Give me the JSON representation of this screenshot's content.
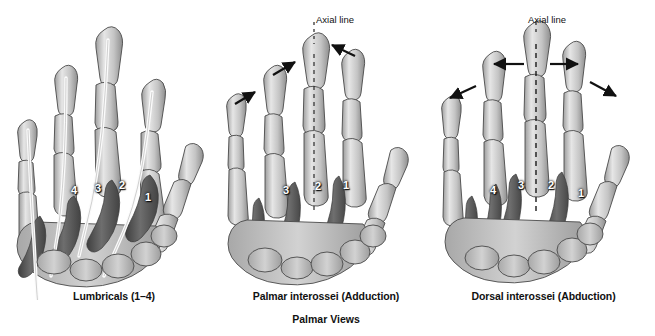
{
  "figure": {
    "title": "Palmar Views",
    "background": "#ffffff",
    "ink": "#111111"
  },
  "panels": [
    {
      "id": "lumbricals",
      "caption": "Lumbricals (1–4)",
      "axial_line_label": "",
      "has_axial_line": false,
      "muscle_numbers": [
        "4",
        "3",
        "2",
        "1"
      ],
      "arrow_direction": "none"
    },
    {
      "id": "palmar-interossei",
      "caption": "Palmar interossei (Adduction)",
      "axial_line_label": "Axial line",
      "has_axial_line": true,
      "muscle_numbers": [
        "3",
        "2",
        "1"
      ],
      "arrow_direction": "inward"
    },
    {
      "id": "dorsal-interossei",
      "caption": "Dorsal interossei (Abduction)",
      "axial_line_label": "Axial line",
      "has_axial_line": true,
      "muscle_numbers": [
        "4",
        "3",
        "2",
        "1"
      ],
      "arrow_direction": "outward"
    }
  ],
  "colors": {
    "bone_fill": "#c9c9c9",
    "bone_light": "#e2e2e2",
    "bone_shadow": "#9a9a9a",
    "bone_outline": "#4a4a4a",
    "muscle_dark": "#555555",
    "muscle_mid": "#787878",
    "tendon_white": "#fbfbfb",
    "arrow": "#111111",
    "label_text": "#ffffff"
  }
}
